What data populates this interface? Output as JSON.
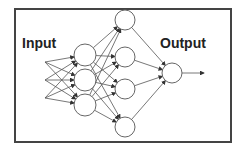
{
  "diagram": {
    "type": "neural-network",
    "labels": {
      "input": "Input",
      "output": "Output"
    },
    "colors": {
      "frame": "#444444",
      "node_stroke": "#666666",
      "edge": "#555555",
      "text": "#222222"
    },
    "frame": {
      "x": 15,
      "y": 9,
      "w": 216,
      "h": 133
    },
    "inputs": [
      {
        "x": 45,
        "y": 62
      },
      {
        "x": 45,
        "y": 80
      },
      {
        "x": 45,
        "y": 98
      }
    ],
    "layers": [
      {
        "name": "hidden-1",
        "r": 11,
        "nodes": [
          {
            "x": 85,
            "y": 55
          },
          {
            "x": 85,
            "y": 80
          },
          {
            "x": 85,
            "y": 105
          }
        ]
      },
      {
        "name": "hidden-2",
        "r": 10,
        "nodes": [
          {
            "x": 125,
            "y": 20
          },
          {
            "x": 125,
            "y": 57
          },
          {
            "x": 125,
            "y": 89
          },
          {
            "x": 125,
            "y": 127
          }
        ]
      },
      {
        "name": "output",
        "r": 10,
        "nodes": [
          {
            "x": 172,
            "y": 73
          }
        ]
      }
    ],
    "output_arrow": {
      "x1": 182,
      "y1": 73,
      "x2": 204,
      "y2": 73
    }
  }
}
